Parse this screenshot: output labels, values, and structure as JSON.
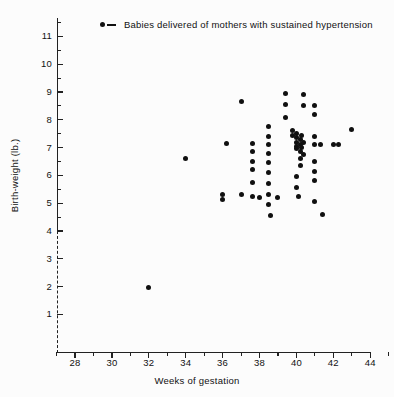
{
  "chart_data": {
    "type": "scatter",
    "title": "",
    "xlabel": "Weeks of gestation",
    "ylabel": "Birth-weight (lb.)",
    "xlim": [
      27,
      45
    ],
    "ylim": [
      1,
      11.6
    ],
    "grid": false,
    "legend_position": "top-center",
    "y_axis_break": {
      "between": [
        3.6,
        1.0
      ],
      "style": "dash-dot"
    },
    "xticks_major": [
      28,
      30,
      32,
      34,
      36,
      38,
      40,
      42,
      44
    ],
    "xticks_minor": [
      27,
      29,
      31,
      33,
      35,
      37,
      39,
      41,
      43,
      45
    ],
    "xtick_labels": [
      "28",
      "30",
      "32",
      "34",
      "36",
      "38",
      "40",
      "42",
      "44"
    ],
    "yticks_major": [
      1,
      2,
      3,
      4,
      5,
      6,
      7,
      8,
      9,
      10,
      11
    ],
    "ytick_labels": [
      "1",
      "2",
      "3",
      "4",
      "5",
      "6",
      "7",
      "8",
      "9",
      "10",
      "11"
    ],
    "series": [
      {
        "name": "Babies delivered of mothers with sustained hypertension",
        "marker": "filled-circle",
        "color": "#101010",
        "points": [
          [
            32.0,
            1.95
          ],
          [
            34.0,
            6.6
          ],
          [
            36.0,
            5.3
          ],
          [
            36.0,
            5.15
          ],
          [
            36.2,
            7.15
          ],
          [
            37.0,
            8.65
          ],
          [
            37.0,
            5.3
          ],
          [
            37.6,
            7.15
          ],
          [
            37.6,
            6.85
          ],
          [
            37.6,
            6.5
          ],
          [
            37.6,
            6.2
          ],
          [
            37.6,
            5.75
          ],
          [
            37.6,
            5.25
          ],
          [
            38.0,
            5.2
          ],
          [
            38.5,
            7.75
          ],
          [
            38.5,
            7.4
          ],
          [
            38.5,
            7.1
          ],
          [
            38.5,
            6.8
          ],
          [
            38.5,
            6.45
          ],
          [
            38.5,
            6.1
          ],
          [
            38.5,
            5.7
          ],
          [
            38.5,
            5.3
          ],
          [
            38.5,
            4.95
          ],
          [
            38.6,
            4.55
          ],
          [
            39.0,
            5.2
          ],
          [
            39.4,
            8.95
          ],
          [
            39.4,
            8.55
          ],
          [
            39.4,
            8.1
          ],
          [
            39.8,
            7.6
          ],
          [
            39.8,
            7.45
          ],
          [
            40.0,
            7.5
          ],
          [
            40.0,
            7.35
          ],
          [
            40.0,
            7.2
          ],
          [
            40.0,
            7.05
          ],
          [
            40.0,
            6.95
          ],
          [
            40.2,
            7.3
          ],
          [
            40.2,
            7.1
          ],
          [
            40.2,
            6.85
          ],
          [
            40.2,
            6.6
          ],
          [
            40.2,
            6.35
          ],
          [
            40.3,
            7.45
          ],
          [
            40.3,
            7.0
          ],
          [
            40.4,
            7.2
          ],
          [
            40.4,
            6.75
          ],
          [
            40.0,
            5.95
          ],
          [
            40.0,
            5.55
          ],
          [
            40.1,
            5.25
          ],
          [
            40.4,
            8.9
          ],
          [
            40.4,
            8.5
          ],
          [
            41.0,
            8.5
          ],
          [
            41.0,
            8.2
          ],
          [
            41.0,
            7.4
          ],
          [
            41.0,
            7.1
          ],
          [
            41.3,
            7.1
          ],
          [
            41.0,
            6.5
          ],
          [
            41.0,
            6.15
          ],
          [
            41.0,
            5.8
          ],
          [
            41.0,
            5.05
          ],
          [
            41.4,
            4.6
          ],
          [
            42.0,
            7.1
          ],
          [
            42.3,
            7.1
          ],
          [
            43.0,
            7.65
          ]
        ]
      }
    ]
  },
  "legend": {
    "marker_name": "filled-circle-dash",
    "label": "Babies delivered of mothers with sustained hypertension"
  },
  "axes": {
    "x_title": "Weeks of gestation",
    "y_title": "Birth-weight (lb.)"
  }
}
